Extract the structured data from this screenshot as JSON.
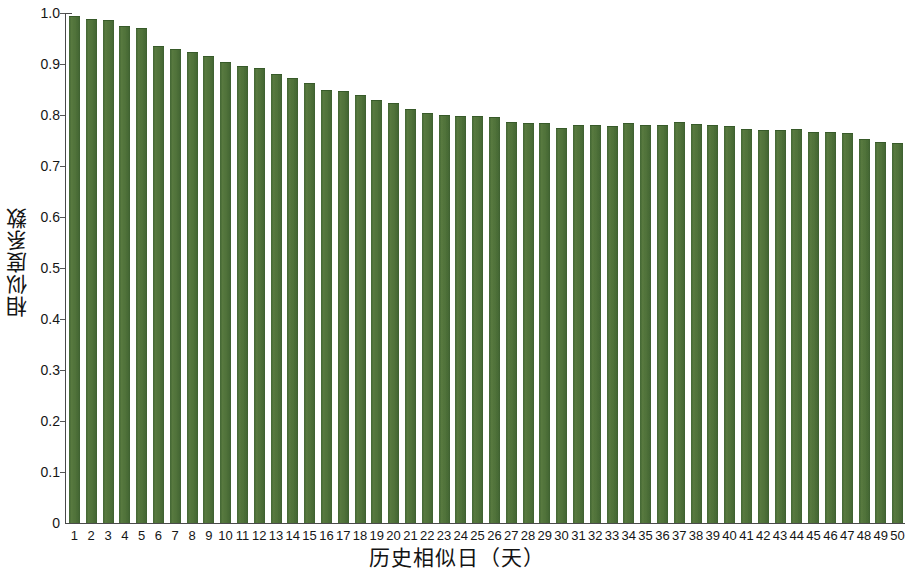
{
  "chart_data": {
    "type": "bar",
    "title": "",
    "subtitle": "",
    "xlabel": "历史相似日（天）",
    "ylabel": "相似度系数",
    "grid": false,
    "legend": null,
    "ylim": [
      0,
      1.0
    ],
    "ytick_labels": [
      "1.0",
      "0.9",
      "0.8",
      "0.7",
      "0.6",
      "0.5",
      "0.4",
      "0.3",
      "0.2",
      "0.1",
      "0"
    ],
    "ytick_values": [
      1.0,
      0.9,
      0.8,
      0.7,
      0.6,
      0.5,
      0.4,
      0.3,
      0.2,
      0.1,
      0
    ],
    "bar_color": "#4e7237",
    "categories": [
      "1",
      "2",
      "3",
      "4",
      "5",
      "6",
      "7",
      "8",
      "9",
      "10",
      "11",
      "12",
      "13",
      "14",
      "15",
      "16",
      "17",
      "18",
      "19",
      "20",
      "21",
      "22",
      "23",
      "24",
      "25",
      "26",
      "27",
      "28",
      "29",
      "30",
      "31",
      "32",
      "33",
      "34",
      "35",
      "36",
      "37",
      "38",
      "39",
      "40",
      "41",
      "42",
      "43",
      "44",
      "45",
      "46",
      "47",
      "48",
      "49",
      "50"
    ],
    "values": [
      0.995,
      0.989,
      0.986,
      0.975,
      0.97,
      0.936,
      0.93,
      0.924,
      0.916,
      0.904,
      0.896,
      0.892,
      0.88,
      0.872,
      0.862,
      0.85,
      0.848,
      0.84,
      0.83,
      0.824,
      0.812,
      0.804,
      0.8,
      0.798,
      0.798,
      0.796,
      0.786,
      0.784,
      0.785,
      0.775,
      0.78,
      0.78,
      0.778,
      0.784,
      0.78,
      0.781,
      0.786,
      0.782,
      0.78,
      0.778,
      0.772,
      0.771,
      0.77,
      0.772,
      0.766,
      0.766,
      0.764,
      0.752,
      0.748,
      0.745
    ]
  }
}
